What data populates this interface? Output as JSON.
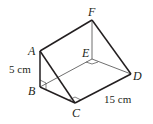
{
  "figure": {
    "type": "triangular-prism",
    "vertices": {
      "A": {
        "label": "A",
        "x": 40,
        "y": 51
      },
      "B": {
        "label": "B",
        "x": 40,
        "y": 87
      },
      "C": {
        "label": "C",
        "x": 75,
        "y": 103
      },
      "D": {
        "label": "D",
        "x": 131,
        "y": 74
      },
      "E": {
        "label": "E",
        "x": 92,
        "y": 59
      },
      "F": {
        "label": "F",
        "x": 92,
        "y": 20
      }
    },
    "edges_visible": [
      "AB",
      "BC",
      "AC",
      "AF",
      "CD",
      "FD"
    ],
    "edges_hidden": [
      "FE",
      "ED",
      "BE"
    ],
    "right_angles": [
      "B",
      "C",
      "E"
    ],
    "dimensions": {
      "AB": "5 cm",
      "CD": "15 cm"
    },
    "colors": {
      "stroke": "#231f20",
      "hidden_stroke": "#555555",
      "background": "#ffffff"
    }
  }
}
